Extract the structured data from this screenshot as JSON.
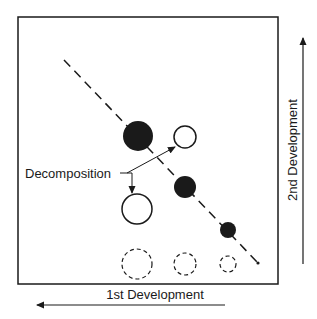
{
  "diagram": {
    "decomposition_label": "Decomposition",
    "x_axis_label": "1st Development",
    "y_axis_label": "2nd Development",
    "colors": {
      "ink": "#1a1a1a",
      "background": "#ffffff"
    },
    "filled_spots": [
      {
        "cx": 138,
        "cy": 136,
        "r": 15
      },
      {
        "cx": 185,
        "cy": 187,
        "r": 11
      },
      {
        "cx": 228,
        "cy": 230,
        "r": 8
      }
    ],
    "hollow_spots": [
      {
        "cx": 185,
        "cy": 137,
        "r": 11
      },
      {
        "cx": 137,
        "cy": 209,
        "r": 15
      }
    ],
    "dashed_spots": [
      {
        "cx": 137,
        "cy": 264,
        "r": 15
      },
      {
        "cx": 185,
        "cy": 264,
        "r": 11
      },
      {
        "cx": 228,
        "cy": 264,
        "r": 8
      }
    ]
  }
}
